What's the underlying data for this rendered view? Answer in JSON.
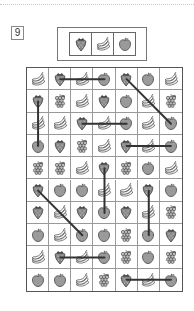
{
  "puzzle": {
    "number": "9",
    "key_sequence": [
      "strawberry",
      "banana",
      "apple"
    ],
    "rows": 10,
    "cols": 7,
    "grid": [
      [
        "banana",
        "strawberry",
        "banana",
        "apple",
        "strawberry",
        "apple",
        "banana"
      ],
      [
        "strawberry",
        "grapes",
        "banana",
        "strawberry",
        "apple",
        "banana",
        "grapes"
      ],
      [
        "banana",
        "banana",
        "strawberry",
        "banana",
        "apple",
        "banana",
        "apple"
      ],
      [
        "apple",
        "strawberry",
        "grapes",
        "banana",
        "strawberry",
        "banana",
        "apple"
      ],
      [
        "grapes",
        "grapes",
        "banana",
        "strawberry",
        "grapes",
        "apple",
        "banana"
      ],
      [
        "strawberry",
        "apple",
        "apple",
        "banana",
        "banana",
        "strawberry",
        "apple"
      ],
      [
        "strawberry",
        "banana",
        "strawberry",
        "apple",
        "strawberry",
        "banana",
        "grapes"
      ],
      [
        "apple",
        "banana",
        "apple",
        "apple",
        "grapes",
        "apple",
        "strawberry"
      ],
      [
        "banana",
        "strawberry",
        "banana",
        "apple",
        "grapes",
        "apple",
        "grapes"
      ],
      [
        "apple",
        "apple",
        "banana",
        "grapes",
        "strawberry",
        "banana",
        "apple"
      ]
    ],
    "connections": [
      {
        "from": [
          0,
          1
        ],
        "to": [
          0,
          3
        ]
      },
      {
        "from": [
          0,
          4
        ],
        "to": [
          2,
          6
        ]
      },
      {
        "from": [
          1,
          0
        ],
        "to": [
          3,
          0
        ]
      },
      {
        "from": [
          2,
          2
        ],
        "to": [
          2,
          4
        ]
      },
      {
        "from": [
          3,
          4
        ],
        "to": [
          3,
          6
        ]
      },
      {
        "from": [
          4,
          3
        ],
        "to": [
          6,
          3
        ]
      },
      {
        "from": [
          5,
          0
        ],
        "to": [
          7,
          2
        ]
      },
      {
        "from": [
          5,
          5
        ],
        "to": [
          7,
          5
        ]
      },
      {
        "from": [
          8,
          1
        ],
        "to": [
          8,
          3
        ]
      },
      {
        "from": [
          9,
          4
        ],
        "to": [
          9,
          6
        ]
      }
    ]
  },
  "colors": {
    "line": "#333333",
    "apple_fill": "#9a9a9a",
    "outline": "#444444"
  }
}
